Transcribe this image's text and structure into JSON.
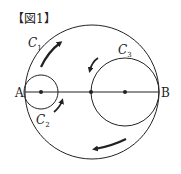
{
  "figure": {
    "title": "【図1】",
    "labels": {
      "c1": "C",
      "c1_sub": "1",
      "c2": "C",
      "c2_sub": "2",
      "c3": "C",
      "c3_sub": "3",
      "point_a": "A",
      "point_b": "B"
    },
    "colors": {
      "stroke": "#222222",
      "background": "#ffffff"
    }
  }
}
